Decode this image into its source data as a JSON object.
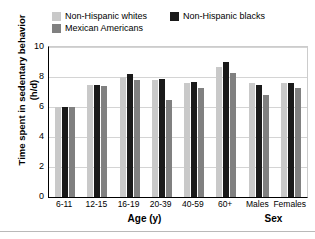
{
  "chart_data": {
    "type": "bar",
    "title": "",
    "xlabel": "Age (y)",
    "xlabel2": "Sex",
    "ylabel": "Time spent in sedentary behavior (h/d)",
    "ylim": [
      0,
      10
    ],
    "yticks": [
      0,
      2,
      4,
      6,
      8,
      10
    ],
    "grid": true,
    "legend_position": "top-left",
    "categories": [
      "6-11",
      "12-15",
      "16-19",
      "20-39",
      "40-59",
      "60+",
      "Males",
      "Females"
    ],
    "group_labels": {
      "age": [
        "6-11",
        "12-15",
        "16-19",
        "20-39",
        "40-59",
        "60+"
      ],
      "sex": [
        "Males",
        "Females"
      ]
    },
    "series": [
      {
        "name": "Non-Hispanic whites",
        "color": "#c9c9c9",
        "values": [
          6.0,
          7.5,
          8.0,
          7.8,
          7.6,
          8.7,
          7.6,
          7.6
        ]
      },
      {
        "name": "Non-Hispanic blacks",
        "color": "#1a1a1a",
        "values": [
          6.0,
          7.5,
          8.2,
          7.9,
          7.7,
          9.0,
          7.5,
          7.6
        ]
      },
      {
        "name": "Mexican Americans",
        "color": "#808080",
        "values": [
          6.0,
          7.4,
          7.8,
          6.5,
          7.3,
          8.3,
          6.8,
          7.3
        ]
      }
    ]
  },
  "legend": {
    "rows": [
      [
        {
          "label": "Non-Hispanic whites",
          "color": "#c9c9c9",
          "swatch_name": "legend-swatch-non-hispanic-whites"
        },
        {
          "label": "Non-Hispanic blacks",
          "color": "#1a1a1a",
          "swatch_name": "legend-swatch-non-hispanic-blacks"
        }
      ],
      [
        {
          "label": "Mexican Americans",
          "color": "#808080",
          "swatch_name": "legend-swatch-mexican-americans"
        }
      ]
    ]
  },
  "axes": {
    "y_title": "Time spent in sedentary behavior (h/d)",
    "x_title_age": "Age (y)",
    "x_title_sex": "Sex"
  }
}
